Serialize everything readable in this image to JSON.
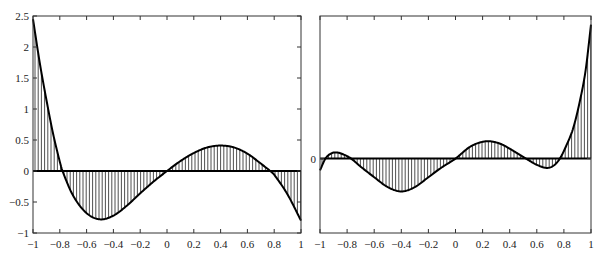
{
  "chart_data": [
    {
      "type": "area",
      "title": "",
      "xlabel": "",
      "ylabel": "",
      "xlim": [
        -1,
        1
      ],
      "ylim": [
        -1,
        2.5
      ],
      "grid": false,
      "fill": "vertical hatching between curve and y=0",
      "x_ticks": [
        "-1",
        "-0.8",
        "-0.6",
        "-0.4",
        "-0.2",
        "0",
        "0.2",
        "0.4",
        "0.6",
        "0.8",
        "1"
      ],
      "y_ticks": [
        "-1",
        "-0.5",
        "0",
        "0.5",
        "1",
        "1.5",
        "2",
        "2.5"
      ],
      "x": [
        -1,
        -0.95,
        -0.9,
        -0.85,
        -0.8,
        -0.78,
        -0.7,
        -0.6,
        -0.5,
        -0.4,
        -0.3,
        -0.2,
        -0.1,
        0,
        0.1,
        0.2,
        0.3,
        0.4,
        0.5,
        0.6,
        0.7,
        0.77,
        0.8,
        0.9,
        1
      ],
      "values": [
        2.45,
        1.75,
        1.15,
        0.6,
        0.15,
        0,
        -0.4,
        -0.68,
        -0.78,
        -0.72,
        -0.56,
        -0.36,
        -0.17,
        0,
        0.16,
        0.29,
        0.38,
        0.41,
        0.38,
        0.28,
        0.12,
        0,
        -0.06,
        -0.38,
        -0.8
      ]
    },
    {
      "type": "area",
      "title": "",
      "xlabel": "",
      "ylabel": "",
      "xlim": [
        -1,
        1
      ],
      "ylim": [
        -1.2,
        2.3
      ],
      "grid": false,
      "fill": "vertical hatching between curve and y=0",
      "x_ticks": [
        "-1",
        "-0.8",
        "-0.6",
        "-0.4",
        "-0.2",
        "0",
        "0.2",
        "0.4",
        "0.6",
        "0.8",
        "1"
      ],
      "y_ticks": [
        "0"
      ],
      "x": [
        -1,
        -0.96,
        -0.92,
        -0.88,
        -0.83,
        -0.77,
        -0.7,
        -0.6,
        -0.5,
        -0.4,
        -0.3,
        -0.2,
        -0.1,
        0,
        0.1,
        0.18,
        0.25,
        0.33,
        0.4,
        0.46,
        0.52,
        0.6,
        0.67,
        0.72,
        0.77,
        0.82,
        0.87,
        0.92,
        0.96,
        1
      ],
      "values": [
        -0.19,
        0,
        0.08,
        0.1,
        0.07,
        0,
        -0.13,
        -0.3,
        -0.46,
        -0.53,
        -0.46,
        -0.3,
        -0.14,
        0,
        0.18,
        0.26,
        0.28,
        0.24,
        0.16,
        0.08,
        0,
        -0.1,
        -0.15,
        -0.12,
        0,
        0.22,
        0.5,
        0.95,
        1.42,
        2.16
      ]
    }
  ]
}
